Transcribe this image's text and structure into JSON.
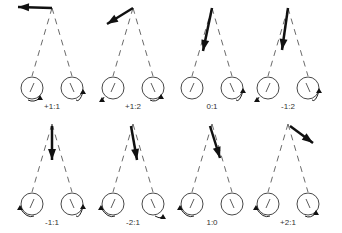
{
  "panels": [
    {
      "label": "+1:1",
      "cx": 52,
      "cy": 0,
      "arrow": {
        "x1": 52,
        "y1": 8,
        "x2": 18,
        "y2": 7
      },
      "leftRot": "cw-bottom",
      "rightRot": "ccw-right"
    },
    {
      "label": "+1:2",
      "cx": 133,
      "cy": 0,
      "arrow": {
        "x1": 133,
        "y1": 8,
        "x2": 107,
        "y2": 24
      },
      "leftRot": "left-bottom",
      "rightRot": "bottom"
    },
    {
      "label": "0:1",
      "cx": 212,
      "cy": 0,
      "arrow": {
        "x1": 212,
        "y1": 8,
        "x2": 203,
        "y2": 51
      },
      "leftRot": "none",
      "rightRot": "right"
    },
    {
      "label": "-1:2",
      "cx": 288,
      "cy": 0,
      "arrow": {
        "x1": 288,
        "y1": 8,
        "x2": 282,
        "y2": 50
      },
      "leftRot": "left-bottom",
      "rightRot": "right"
    },
    {
      "label": "-1:1",
      "cx": 52,
      "cy": 116,
      "arrow": {
        "x1": 52,
        "y1": 126,
        "x2": 52,
        "y2": 160
      },
      "leftRot": "left",
      "rightRot": "right"
    },
    {
      "label": "-2:1",
      "cx": 133,
      "cy": 116,
      "arrow": {
        "x1": 131,
        "y1": 126,
        "x2": 137,
        "y2": 160
      },
      "leftRot": "left",
      "rightRot": "bottom-right"
    },
    {
      "label": "1:0",
      "cx": 212,
      "cy": 116,
      "arrow": {
        "x1": 210,
        "y1": 126,
        "x2": 220,
        "y2": 158
      },
      "leftRot": "left",
      "rightRot": "none"
    },
    {
      "label": "+2:1",
      "cx": 288,
      "cy": 116,
      "arrow": {
        "x1": 290,
        "y1": 126,
        "x2": 313,
        "y2": 143
      },
      "leftRot": "left",
      "rightRot": "bottom"
    }
  ]
}
